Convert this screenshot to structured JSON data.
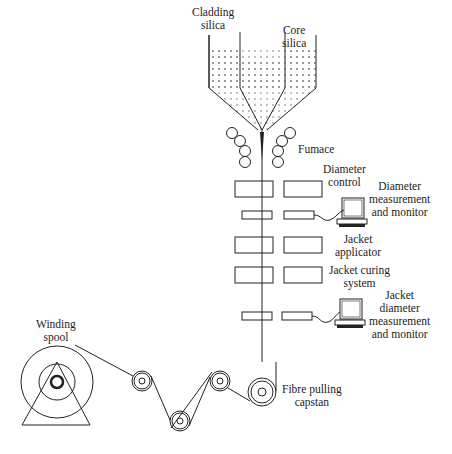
{
  "diagram": {
    "labels": {
      "cladding_silica": [
        "Cladding",
        "silica"
      ],
      "core_silica": [
        "Core",
        "silica"
      ],
      "furnace": "Fumace",
      "diameter_control": [
        "Diameter",
        "control"
      ],
      "diameter_measurement": [
        "Diameter",
        "measurement",
        "and monitor"
      ],
      "jacket_applicator": [
        "Jacket",
        "applicator"
      ],
      "jacket_curing": [
        "Jacket curing",
        "system"
      ],
      "jacket_diameter_measurement": [
        "Jacket",
        "diameter",
        "measurement",
        "and monitor"
      ],
      "winding_spool": [
        "Winding",
        "spool"
      ],
      "fibre_pulling_capstan": [
        "Fibre pulling",
        "capstan"
      ]
    },
    "components": [
      "outer-crucible",
      "inner-crucible",
      "furnace-heaters",
      "diameter-control-unit",
      "diameter-gauge",
      "diameter-monitor",
      "jacket-applicator",
      "jacket-curing-oven",
      "jacket-diameter-gauge",
      "jacket-monitor",
      "capstan",
      "guide-pulleys",
      "winding-spool"
    ],
    "colors": {
      "line": "#222222",
      "background": "#ffffff",
      "stipple": "#555555"
    }
  }
}
